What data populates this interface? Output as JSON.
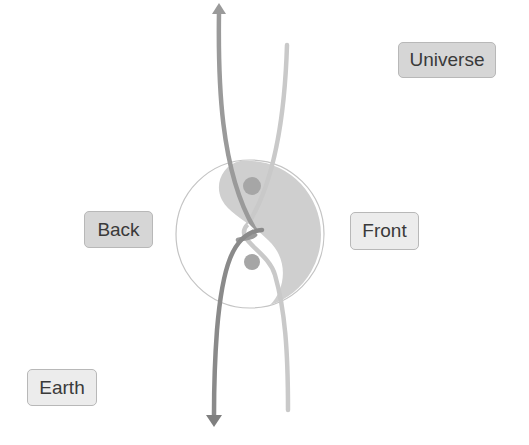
{
  "labels": {
    "universe": "Universe",
    "back": "Back",
    "front": "Front",
    "earth": "Earth"
  },
  "colors": {
    "background": "#ffffff",
    "yin_fill": "#cfcfcf",
    "dot": "#a6a6a6",
    "dark_strand": "#8f8f8f",
    "light_strand": "#c9c9c9",
    "circle_outline": "#c4c4c4"
  }
}
